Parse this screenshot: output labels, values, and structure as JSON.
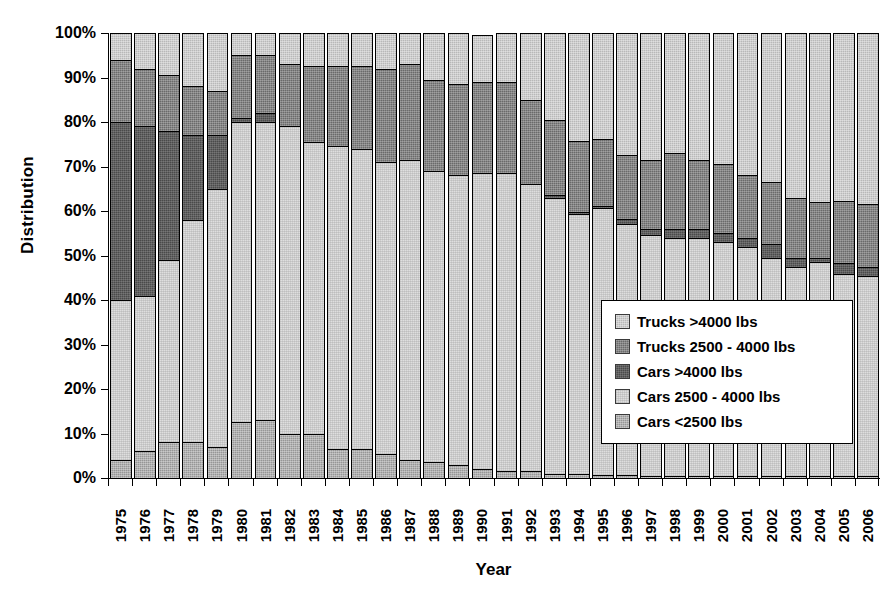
{
  "chart_data": {
    "type": "bar",
    "subtype": "stacked-percent",
    "title": "",
    "xlabel": "Year",
    "ylabel": "Distribution",
    "ylim": [
      0,
      100
    ],
    "ytick_labels": [
      "0%",
      "10%",
      "20%",
      "30%",
      "40%",
      "50%",
      "60%",
      "70%",
      "80%",
      "90%",
      "100%"
    ],
    "ytick_values": [
      0,
      10,
      20,
      30,
      40,
      50,
      60,
      70,
      80,
      90,
      100
    ],
    "grid": false,
    "legend_position": "inside-right-middle",
    "categories": [
      "1975",
      "1976",
      "1977",
      "1978",
      "1979",
      "1980",
      "1981",
      "1982",
      "1983",
      "1984",
      "1985",
      "1986",
      "1987",
      "1988",
      "1989",
      "1990",
      "1991",
      "1992",
      "1993",
      "1994",
      "1995",
      "1996",
      "1997",
      "1998",
      "1999",
      "2000",
      "2001",
      "2002",
      "2003",
      "2004",
      "2005",
      "2006"
    ],
    "stack_order_bottom_to_top": [
      "Cars <2500 lbs",
      "Cars 2500 - 4000 lbs",
      "Cars >4000 lbs",
      "Trucks 2500 - 4000 lbs",
      "Trucks >4000 lbs"
    ],
    "series": [
      {
        "name": "Cars <2500 lbs",
        "color": "#969696",
        "values": [
          4,
          6,
          8,
          8,
          7,
          12.5,
          13,
          10,
          10,
          6.5,
          6.5,
          5.5,
          4,
          3.5,
          3,
          2,
          1.5,
          1.5,
          1,
          0.8,
          0.7,
          0.6,
          0.5,
          0.5,
          0.5,
          0.5,
          0.5,
          0.5,
          0.5,
          0.5,
          0.5,
          0.5
        ]
      },
      {
        "name": "Cars 2500 - 4000 lbs",
        "color": "#dedede",
        "values": [
          36,
          35,
          41,
          50,
          58,
          67.5,
          67,
          69,
          65.5,
          68,
          67.5,
          65.5,
          67.5,
          65.5,
          65,
          66.5,
          67,
          64.5,
          62,
          58.5,
          60,
          56.5,
          54,
          53.5,
          53.5,
          52.5,
          51.5,
          49,
          47,
          48,
          45.5,
          45
        ]
      },
      {
        "name": "Cars >4000 lbs",
        "color": "#4a4a4a",
        "values": [
          40,
          38,
          29,
          19,
          12,
          1,
          2,
          0,
          0,
          0,
          0,
          0,
          0,
          0,
          0,
          0,
          0,
          0,
          0.5,
          0.5,
          0.5,
          1,
          1.5,
          2,
          2,
          2,
          2,
          3,
          2,
          1,
          2.5,
          2
        ]
      },
      {
        "name": "Trucks 2500 - 4000 lbs",
        "color": "#6a6a6a",
        "values": [
          14,
          13,
          12.5,
          11,
          10,
          14,
          13,
          14,
          17,
          18,
          18.5,
          21,
          21.5,
          20.5,
          20.5,
          20.5,
          20.5,
          19,
          17,
          16,
          15,
          14.5,
          15.5,
          17,
          15.5,
          15.5,
          14,
          14,
          13.5,
          12.5,
          14,
          14
        ]
      },
      {
        "name": "Trucks >4000 lbs",
        "color": "#b8b8b8",
        "values": [
          6,
          8,
          9.5,
          12,
          13,
          5,
          5,
          7,
          7.5,
          7.5,
          7.5,
          8,
          7,
          10.5,
          11.5,
          10.5,
          11,
          15,
          19.5,
          24.2,
          23.8,
          27.4,
          28.5,
          27,
          28.5,
          29.5,
          32,
          33.5,
          37,
          38,
          38,
          38.5
        ]
      }
    ]
  },
  "legend": {
    "items": [
      {
        "label": "Trucks >4000 lbs",
        "key": "t4000"
      },
      {
        "label": "Trucks 2500 - 4000 lbs",
        "key": "t2500_4000"
      },
      {
        "label": "Cars >4000 lbs",
        "key": "c4000"
      },
      {
        "label": "Cars 2500 - 4000 lbs",
        "key": "c2500_4000"
      },
      {
        "label": "Cars <2500 lbs",
        "key": "clt2500"
      }
    ]
  },
  "axes": {
    "y_title": "Distribution",
    "x_title": "Year"
  }
}
